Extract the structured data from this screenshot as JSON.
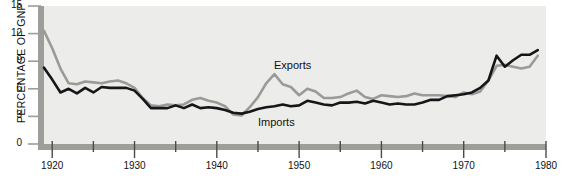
{
  "chart_data": {
    "type": "line",
    "title": "",
    "xlabel": "",
    "ylabel": "PERCENTAGE OF GNP",
    "xlim": [
      1919,
      1980
    ],
    "ylim": [
      0,
      15
    ],
    "grid": false,
    "legend_position": "inline-annotations",
    "yticks": [
      0,
      3,
      6,
      9,
      12,
      15
    ],
    "ytick_labels": [
      "0",
      "3",
      "6",
      "9",
      "12",
      "15"
    ],
    "xticks": [
      1920,
      1925,
      1930,
      1935,
      1940,
      1945,
      1950,
      1955,
      1960,
      1965,
      1970,
      1975,
      1980
    ],
    "xtick_labels": [
      "1920",
      "",
      "1930",
      "",
      "1940",
      "",
      "1950",
      "",
      "1960",
      "",
      "1970",
      "",
      "1980"
    ],
    "xtick_major": [
      1920,
      1930,
      1940,
      1950,
      1960,
      1970,
      1980
    ],
    "annotations": [
      {
        "text": "Exports",
        "x": 1946,
        "y": 8.6
      },
      {
        "text": "Imports",
        "x": 1944,
        "y": 2.2
      }
    ],
    "colors": {
      "exports": "#9a9a98",
      "imports": "#16161a",
      "panel": "#ececea",
      "axis": "#9d9d99",
      "text": "#111111"
    },
    "series": [
      {
        "name": "Exports",
        "color": "#9a9a98",
        "x": [
          1919,
          1920,
          1921,
          1922,
          1923,
          1924,
          1925,
          1926,
          1927,
          1928,
          1929,
          1930,
          1931,
          1932,
          1933,
          1934,
          1935,
          1936,
          1937,
          1938,
          1939,
          1940,
          1941,
          1942,
          1943,
          1944,
          1945,
          1946,
          1947,
          1948,
          1949,
          1950,
          1951,
          1952,
          1953,
          1954,
          1955,
          1956,
          1957,
          1958,
          1959,
          1960,
          1961,
          1962,
          1963,
          1964,
          1965,
          1966,
          1967,
          1968,
          1969,
          1970,
          1971,
          1972,
          1973,
          1974,
          1975,
          1976,
          1977,
          1978,
          1979
        ],
        "values": [
          12.3,
          10.4,
          8.2,
          6.6,
          6.5,
          6.8,
          6.7,
          6.6,
          6.8,
          6.9,
          6.6,
          6.1,
          5.0,
          4.2,
          4.1,
          4.3,
          4.2,
          4.3,
          4.8,
          5.0,
          4.7,
          4.5,
          4.1,
          3.2,
          3.1,
          4.0,
          5.1,
          6.6,
          7.6,
          6.5,
          6.2,
          5.3,
          6.0,
          5.7,
          5.0,
          5.0,
          5.1,
          5.5,
          5.8,
          5.1,
          4.9,
          5.3,
          5.2,
          5.1,
          5.2,
          5.5,
          5.3,
          5.3,
          5.3,
          5.2,
          5.1,
          5.6,
          5.4,
          5.7,
          6.9,
          8.5,
          8.6,
          8.4,
          8.2,
          8.4,
          9.6
        ]
      },
      {
        "name": "Imports",
        "color": "#16161a",
        "x": [
          1919,
          1920,
          1921,
          1922,
          1923,
          1924,
          1925,
          1926,
          1927,
          1928,
          1929,
          1930,
          1931,
          1932,
          1933,
          1934,
          1935,
          1936,
          1937,
          1938,
          1939,
          1940,
          1941,
          1942,
          1943,
          1944,
          1945,
          1946,
          1947,
          1948,
          1949,
          1950,
          1951,
          1952,
          1953,
          1954,
          1955,
          1956,
          1957,
          1958,
          1959,
          1960,
          1961,
          1962,
          1963,
          1964,
          1965,
          1966,
          1967,
          1968,
          1969,
          1970,
          1971,
          1972,
          1973,
          1974,
          1975,
          1976,
          1977,
          1978,
          1979
        ],
        "values": [
          8.3,
          7.0,
          5.6,
          6.0,
          5.5,
          6.1,
          5.6,
          6.2,
          6.1,
          6.1,
          6.1,
          5.8,
          4.9,
          3.9,
          3.9,
          3.9,
          4.2,
          3.9,
          4.3,
          3.9,
          4.0,
          3.9,
          3.7,
          3.4,
          3.3,
          3.5,
          3.8,
          4.0,
          4.1,
          4.3,
          4.1,
          4.2,
          4.7,
          4.5,
          4.3,
          4.2,
          4.5,
          4.5,
          4.6,
          4.4,
          4.7,
          4.5,
          4.3,
          4.4,
          4.3,
          4.3,
          4.5,
          4.8,
          4.8,
          5.2,
          5.3,
          5.4,
          5.6,
          6.1,
          6.9,
          9.6,
          8.4,
          9.1,
          9.7,
          9.7,
          10.2
        ]
      }
    ]
  },
  "axes": {
    "y_title": "PERCENTAGE OF GNP"
  }
}
